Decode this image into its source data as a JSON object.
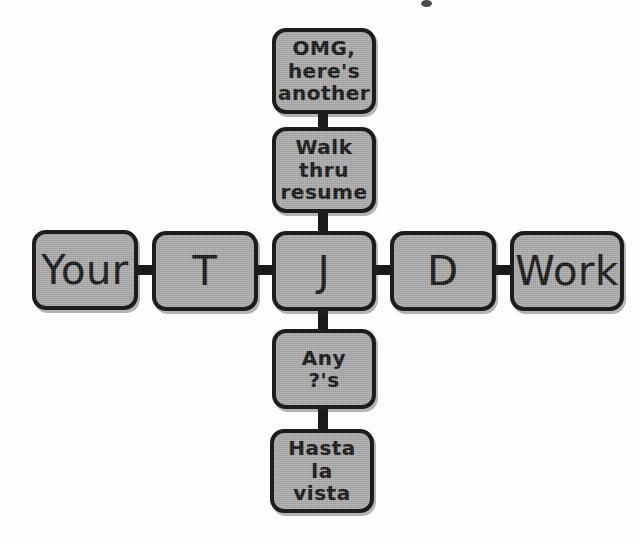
{
  "diagram": {
    "type": "cross-flowchart",
    "background_color": "#fdfdfd",
    "node_fill_color": "#a9a9a9",
    "node_border_color": "#1c1c1c",
    "connector_color": "#1a1a1a",
    "nodes": [
      {
        "id": "omg",
        "label": "OMG,\nhere's\nanother",
        "branch": "up",
        "x": 272,
        "y": 28,
        "w": 104,
        "h": 86,
        "style": "multi"
      },
      {
        "id": "walk",
        "label": "Walk\nthru\nresume",
        "branch": "up",
        "x": 272,
        "y": 127,
        "w": 104,
        "h": 86,
        "style": "multi"
      },
      {
        "id": "your",
        "label": "Your",
        "branch": "left",
        "x": 32,
        "y": 230,
        "w": 106,
        "h": 80,
        "style": "big"
      },
      {
        "id": "t",
        "label": "T",
        "branch": "left",
        "x": 152,
        "y": 231,
        "w": 106,
        "h": 80,
        "style": "big"
      },
      {
        "id": "j",
        "label": "J",
        "branch": "center",
        "x": 272,
        "y": 231,
        "w": 104,
        "h": 80,
        "style": "big"
      },
      {
        "id": "d",
        "label": "D",
        "branch": "right",
        "x": 390,
        "y": 231,
        "w": 106,
        "h": 80,
        "style": "big"
      },
      {
        "id": "work",
        "label": "Work",
        "branch": "right",
        "x": 510,
        "y": 231,
        "w": 114,
        "h": 80,
        "style": "big"
      },
      {
        "id": "any",
        "label": "Any\n?'s",
        "branch": "down",
        "x": 272,
        "y": 329,
        "w": 104,
        "h": 80,
        "style": "multi"
      },
      {
        "id": "hasta",
        "label": "Hasta la\nvista",
        "branch": "down",
        "x": 270,
        "y": 429,
        "w": 104,
        "h": 84,
        "style": "multi"
      }
    ],
    "connectors": [
      {
        "id": "omg-walk",
        "orientation": "vertical",
        "x": 318,
        "y": 110,
        "w": 10,
        "h": 20
      },
      {
        "id": "walk-j",
        "orientation": "vertical",
        "x": 318,
        "y": 209,
        "w": 10,
        "h": 25
      },
      {
        "id": "your-t",
        "orientation": "horizontal",
        "x": 134,
        "y": 265,
        "w": 22,
        "h": 10
      },
      {
        "id": "t-j",
        "orientation": "horizontal",
        "x": 254,
        "y": 265,
        "w": 22,
        "h": 10
      },
      {
        "id": "j-d",
        "orientation": "horizontal",
        "x": 372,
        "y": 265,
        "w": 22,
        "h": 10
      },
      {
        "id": "d-work",
        "orientation": "horizontal",
        "x": 492,
        "y": 265,
        "w": 22,
        "h": 10
      },
      {
        "id": "j-any",
        "orientation": "vertical",
        "x": 318,
        "y": 307,
        "w": 10,
        "h": 26
      },
      {
        "id": "any-hasta",
        "orientation": "vertical",
        "x": 318,
        "y": 405,
        "w": 10,
        "h": 28
      }
    ],
    "artifacts": [
      {
        "id": "scan-speck",
        "x": 421,
        "y": 0,
        "w": 11,
        "h": 7
      }
    ]
  }
}
